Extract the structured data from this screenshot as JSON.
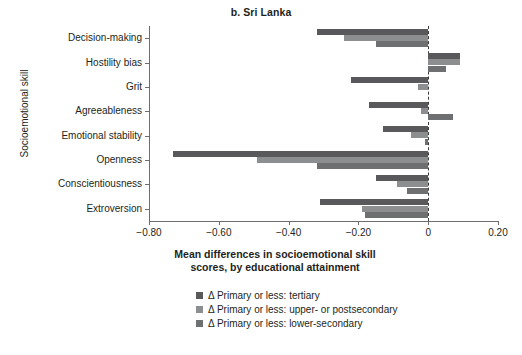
{
  "chart_data": {
    "type": "bar",
    "orientation": "horizontal",
    "title": "b. Sri Lanka",
    "xlabel": "Mean differences in socioemotional skill scores, by educational attainment",
    "xlabel_line1": "Mean differences in socioemotional skill",
    "xlabel_line2": "scores, by educational attainment",
    "ylabel": "Socioemotional skill",
    "categories": [
      "Decision-making",
      "Hostility bias",
      "Grit",
      "Agreeableness",
      "Emotional stability",
      "Openness",
      "Conscientiousness",
      "Extroversion"
    ],
    "xlim": [
      -0.8,
      0.2
    ],
    "xticks": [
      -0.8,
      -0.6,
      -0.4,
      -0.2,
      0,
      0.2
    ],
    "xtick_labels": [
      "−0.80",
      "−0.60",
      "−0.40",
      "−0.20",
      "0",
      "0.20"
    ],
    "grid": false,
    "zero_reference_line": true,
    "legend_position": "below",
    "series": [
      {
        "name": "Δ Primary or less: tertiary",
        "color": "#59595b",
        "values": [
          -0.32,
          0.09,
          -0.22,
          -0.17,
          -0.13,
          -0.73,
          -0.15,
          -0.31
        ]
      },
      {
        "name": "Δ Primary or less: upper- or postsecondary",
        "color": "#8d8e90",
        "values": [
          -0.24,
          0.09,
          -0.03,
          -0.02,
          -0.05,
          -0.49,
          -0.09,
          -0.19
        ]
      },
      {
        "name": "Δ Primary or less: lower-secondary",
        "color": "#6e6f71",
        "values": [
          -0.15,
          0.05,
          0.0,
          0.07,
          -0.01,
          -0.32,
          -0.06,
          -0.18
        ]
      }
    ]
  },
  "colors": {
    "axis": "#6e6e6e",
    "text": "#231f20",
    "background": "#ffffff",
    "zero_line": "#3b3b3b"
  }
}
